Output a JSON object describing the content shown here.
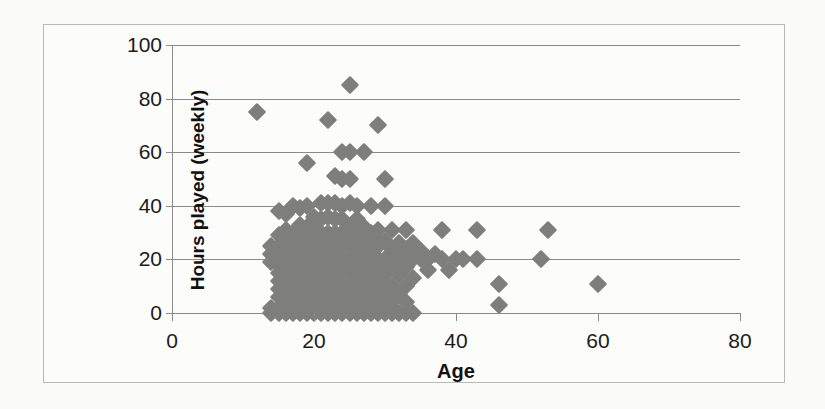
{
  "chart_data": {
    "type": "scatter",
    "title": "",
    "xlabel": "Age",
    "ylabel": "Hours played (weekly)",
    "xlim": [
      0,
      80
    ],
    "ylim": [
      0,
      100
    ],
    "xticks": [
      0,
      20,
      40,
      60,
      80
    ],
    "yticks": [
      0,
      20,
      40,
      60,
      80,
      100
    ],
    "xtick_labels": [
      "0",
      "20",
      "40",
      "60",
      "80"
    ],
    "ytick_labels": [
      "0",
      "20",
      "40",
      "60",
      "80",
      "100"
    ],
    "grid": "horizontal",
    "legend": "none",
    "marker": "diamond",
    "marker_color": "#7e7e7c",
    "gridline_color": "#8a8a86",
    "background_color": "#fcfcfa",
    "frame_color": "#b8b8b4",
    "points": [
      [
        25,
        85
      ],
      [
        12,
        75
      ],
      [
        22,
        72
      ],
      [
        29,
        70
      ],
      [
        19,
        56
      ],
      [
        24,
        60
      ],
      [
        25,
        60
      ],
      [
        27,
        60
      ],
      [
        23,
        51
      ],
      [
        24,
        50
      ],
      [
        25,
        50
      ],
      [
        30,
        50
      ],
      [
        21,
        41
      ],
      [
        22,
        41
      ],
      [
        23,
        41
      ],
      [
        24,
        40
      ],
      [
        25,
        41
      ],
      [
        26,
        40
      ],
      [
        17,
        40
      ],
      [
        18,
        39
      ],
      [
        19,
        40
      ],
      [
        28,
        40
      ],
      [
        30,
        40
      ],
      [
        15,
        38
      ],
      [
        16,
        37
      ],
      [
        20,
        36
      ],
      [
        21,
        35
      ],
      [
        22,
        36
      ],
      [
        23,
        35
      ],
      [
        24,
        35
      ],
      [
        26,
        35
      ],
      [
        18,
        33
      ],
      [
        19,
        32
      ],
      [
        20,
        32
      ],
      [
        25,
        32
      ],
      [
        27,
        32
      ],
      [
        29,
        31
      ],
      [
        16,
        31
      ],
      [
        17,
        30
      ],
      [
        21,
        30
      ],
      [
        22,
        30
      ],
      [
        23,
        30
      ],
      [
        24,
        30
      ],
      [
        25,
        30
      ],
      [
        26,
        30
      ],
      [
        28,
        30
      ],
      [
        31,
        31
      ],
      [
        33,
        31
      ],
      [
        38,
        31
      ],
      [
        43,
        31
      ],
      [
        53,
        31
      ],
      [
        15,
        29
      ],
      [
        16,
        28
      ],
      [
        18,
        28
      ],
      [
        19,
        28
      ],
      [
        20,
        28
      ],
      [
        21,
        28
      ],
      [
        22,
        28
      ],
      [
        23,
        28
      ],
      [
        24,
        28
      ],
      [
        25,
        28
      ],
      [
        26,
        27
      ],
      [
        27,
        27
      ],
      [
        29,
        27
      ],
      [
        30,
        27
      ],
      [
        32,
        26
      ],
      [
        34,
        26
      ],
      [
        14,
        25
      ],
      [
        15,
        25
      ],
      [
        16,
        25
      ],
      [
        17,
        25
      ],
      [
        18,
        25
      ],
      [
        19,
        25
      ],
      [
        20,
        25
      ],
      [
        21,
        25
      ],
      [
        22,
        25
      ],
      [
        23,
        25
      ],
      [
        24,
        25
      ],
      [
        25,
        25
      ],
      [
        26,
        25
      ],
      [
        27,
        25
      ],
      [
        28,
        25
      ],
      [
        29,
        25
      ],
      [
        31,
        24
      ],
      [
        33,
        24
      ],
      [
        35,
        23
      ],
      [
        37,
        22
      ],
      [
        14,
        22
      ],
      [
        15,
        21
      ],
      [
        16,
        21
      ],
      [
        17,
        21
      ],
      [
        18,
        21
      ],
      [
        19,
        21
      ],
      [
        20,
        21
      ],
      [
        21,
        21
      ],
      [
        22,
        21
      ],
      [
        23,
        21
      ],
      [
        24,
        21
      ],
      [
        25,
        21
      ],
      [
        26,
        21
      ],
      [
        27,
        21
      ],
      [
        28,
        21
      ],
      [
        29,
        20
      ],
      [
        30,
        20
      ],
      [
        31,
        20
      ],
      [
        32,
        20
      ],
      [
        33,
        20
      ],
      [
        34,
        20
      ],
      [
        35,
        20
      ],
      [
        36,
        20
      ],
      [
        38,
        20
      ],
      [
        40,
        20
      ],
      [
        41,
        20
      ],
      [
        43,
        20
      ],
      [
        52,
        20
      ],
      [
        14,
        19
      ],
      [
        15,
        18
      ],
      [
        16,
        18
      ],
      [
        17,
        18
      ],
      [
        18,
        18
      ],
      [
        19,
        18
      ],
      [
        20,
        18
      ],
      [
        21,
        18
      ],
      [
        22,
        18
      ],
      [
        23,
        18
      ],
      [
        24,
        18
      ],
      [
        25,
        18
      ],
      [
        26,
        18
      ],
      [
        27,
        18
      ],
      [
        28,
        18
      ],
      [
        29,
        18
      ],
      [
        30,
        17
      ],
      [
        31,
        17
      ],
      [
        33,
        17
      ],
      [
        36,
        16
      ],
      [
        39,
        16
      ],
      [
        15,
        15
      ],
      [
        16,
        15
      ],
      [
        17,
        15
      ],
      [
        18,
        15
      ],
      [
        19,
        15
      ],
      [
        20,
        15
      ],
      [
        21,
        15
      ],
      [
        22,
        15
      ],
      [
        23,
        15
      ],
      [
        24,
        15
      ],
      [
        25,
        15
      ],
      [
        26,
        15
      ],
      [
        27,
        15
      ],
      [
        28,
        15
      ],
      [
        29,
        15
      ],
      [
        30,
        14
      ],
      [
        32,
        14
      ],
      [
        34,
        13
      ],
      [
        46,
        11
      ],
      [
        60,
        11
      ],
      [
        15,
        12
      ],
      [
        16,
        12
      ],
      [
        17,
        11
      ],
      [
        18,
        11
      ],
      [
        19,
        11
      ],
      [
        20,
        11
      ],
      [
        21,
        11
      ],
      [
        22,
        11
      ],
      [
        23,
        11
      ],
      [
        24,
        11
      ],
      [
        25,
        11
      ],
      [
        26,
        11
      ],
      [
        27,
        11
      ],
      [
        28,
        11
      ],
      [
        29,
        11
      ],
      [
        30,
        11
      ],
      [
        31,
        10
      ],
      [
        33,
        10
      ],
      [
        15,
        9
      ],
      [
        16,
        8
      ],
      [
        17,
        8
      ],
      [
        18,
        8
      ],
      [
        19,
        8
      ],
      [
        20,
        8
      ],
      [
        21,
        8
      ],
      [
        22,
        8
      ],
      [
        23,
        8
      ],
      [
        24,
        8
      ],
      [
        25,
        8
      ],
      [
        26,
        8
      ],
      [
        27,
        8
      ],
      [
        28,
        8
      ],
      [
        29,
        8
      ],
      [
        30,
        8
      ],
      [
        32,
        7
      ],
      [
        15,
        6
      ],
      [
        16,
        5
      ],
      [
        17,
        5
      ],
      [
        18,
        5
      ],
      [
        19,
        5
      ],
      [
        20,
        5
      ],
      [
        21,
        5
      ],
      [
        22,
        5
      ],
      [
        23,
        5
      ],
      [
        24,
        5
      ],
      [
        25,
        5
      ],
      [
        26,
        5
      ],
      [
        27,
        5
      ],
      [
        28,
        5
      ],
      [
        29,
        5
      ],
      [
        30,
        5
      ],
      [
        31,
        4
      ],
      [
        33,
        4
      ],
      [
        46,
        3
      ],
      [
        14,
        2
      ],
      [
        15,
        2
      ],
      [
        16,
        2
      ],
      [
        17,
        2
      ],
      [
        18,
        2
      ],
      [
        19,
        2
      ],
      [
        20,
        2
      ],
      [
        21,
        2
      ],
      [
        22,
        2
      ],
      [
        23,
        2
      ],
      [
        24,
        2
      ],
      [
        25,
        2
      ],
      [
        26,
        2
      ],
      [
        27,
        2
      ],
      [
        28,
        2
      ],
      [
        29,
        2
      ],
      [
        30,
        2
      ],
      [
        31,
        2
      ],
      [
        14,
        0
      ],
      [
        15,
        0
      ],
      [
        16,
        0
      ],
      [
        17,
        0
      ],
      [
        18,
        0
      ],
      [
        19,
        0
      ],
      [
        20,
        0
      ],
      [
        21,
        0
      ],
      [
        22,
        0
      ],
      [
        23,
        0
      ],
      [
        24,
        0
      ],
      [
        25,
        0
      ],
      [
        26,
        0
      ],
      [
        27,
        0
      ],
      [
        28,
        0
      ],
      [
        29,
        0
      ],
      [
        30,
        0
      ],
      [
        31,
        0
      ],
      [
        32,
        0
      ],
      [
        33,
        0
      ],
      [
        34,
        0
      ]
    ]
  }
}
